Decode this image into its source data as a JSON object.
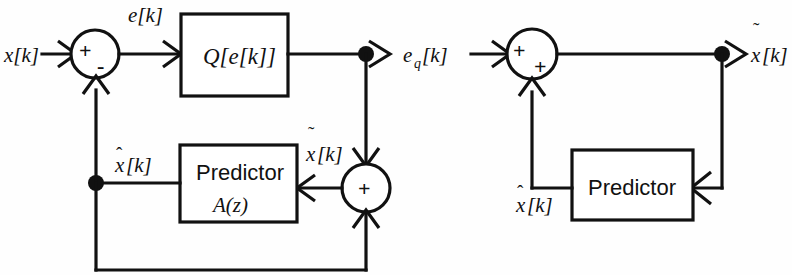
{
  "figure": {
    "line_color": "#111111",
    "background": "#fefefe"
  },
  "encoder": {
    "name": "DPCM Encoder",
    "input_label": "x[k]",
    "error_label": "e[k]",
    "quantizer_label": "Q[e[k]]",
    "quantized_output_label": "e_q[k]",
    "quantized_output_base": "e",
    "quantized_output_sub": "q",
    "quantized_output_tail": "[k]",
    "predictor_label": "Predictor",
    "predictor_transfer_label": "A(z)",
    "prediction_label": "x̂[k]",
    "reconstruction_label": "x̃[k]",
    "summer_sign_plus": "+",
    "summer_sign_minus": "-",
    "adder_sign_plus": "+"
  },
  "decoder": {
    "name": "DPCM Decoder",
    "input_label": "e_q[k]",
    "input_base": "e",
    "input_sub": "q",
    "input_tail": "[k]",
    "output_label": "x̃[k]",
    "predictor_label": "Predictor",
    "prediction_label": "x̂[k]",
    "summer_sign_top": "+",
    "summer_sign_bottom": "+"
  },
  "glyphs": {
    "x_base": "x",
    "bracket_k": "[k]",
    "hat": "ˆ",
    "tilde": "˜"
  }
}
